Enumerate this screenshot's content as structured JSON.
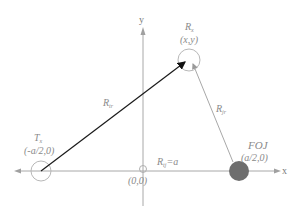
{
  "diagram": {
    "type": "bistatic geometry",
    "axes": {
      "x_label": "x",
      "y_label": "y"
    },
    "nodes": {
      "tx": {
        "name": "T",
        "sub": "x",
        "coord": "(-a/2,0)"
      },
      "rx": {
        "name": "R",
        "sub": "x",
        "coord": "(x,y)"
      },
      "foj": {
        "name": "FOJ",
        "coord": "(a/2,0)"
      },
      "origin": {
        "coord": "(0,0)"
      }
    },
    "edges": {
      "tr": {
        "name": "R",
        "sub": "tr"
      },
      "jr": {
        "name": "R",
        "sub": "jr"
      },
      "tj": {
        "name": "R",
        "sub": "tj",
        "suffix": "=a"
      }
    },
    "colors": {
      "axis": "#a0a0a0",
      "arrow_tr": "#1a1a1a",
      "line_jr": "#a8a8a8",
      "foj_fill": "#6e6e6e",
      "circle_stroke": "#b0b0b0"
    }
  }
}
